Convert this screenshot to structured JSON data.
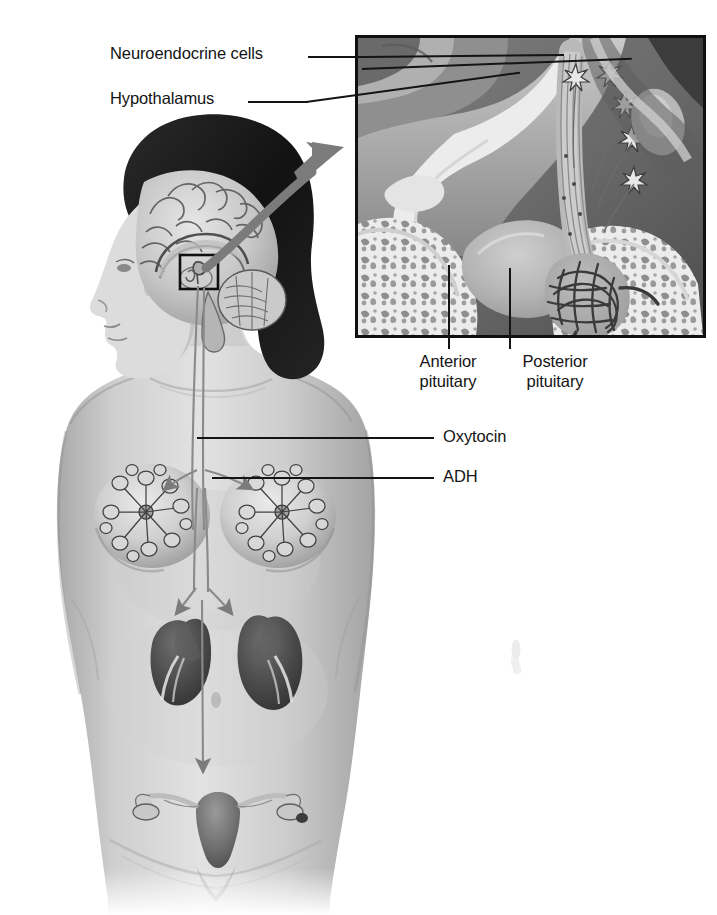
{
  "figure": {
    "medium": "grayscale anatomical illustration"
  },
  "labels": {
    "neuroendocrine_cells": "Neuroendocrine cells",
    "hypothalamus": "Hypothalamus",
    "anterior_pituitary_line1": "Anterior",
    "anterior_pituitary_line2": "pituitary",
    "posterior_pituitary_line1": "Posterior",
    "posterior_pituitary_line2": "pituitary",
    "oxytocin": "Oxytocin",
    "adh": "ADH"
  },
  "inset": {
    "caption": "magnified midsagittal view of the hypothalamus and pituitary gland",
    "structures": [
      "hypothalamus",
      "neuroendocrine cell bodies",
      "hypothalamo-hypophyseal tract axons",
      "infundibulum",
      "anterior pituitary",
      "posterior pituitary capillary plexus",
      "sphenoid bone / sella turcica",
      "optic chiasm"
    ],
    "neuroendocrine_cell_count": 5
  },
  "body_diagram": {
    "structures": [
      "head in profile",
      "brain midsagittal section",
      "cerebellum",
      "pituitary callout box",
      "mammary glands",
      "kidneys",
      "uterus",
      "ovaries",
      "fallopian tubes"
    ],
    "pathways": [
      {
        "hormone": "Oxytocin",
        "targets": [
          "left mammary gland",
          "right mammary gland",
          "uterus"
        ]
      },
      {
        "hormone": "ADH",
        "targets": [
          "left kidney",
          "right kidney"
        ]
      }
    ],
    "callout_arrow": "curved arrow from pituitary box to magnified inset"
  },
  "colors": {
    "ink": "#141414",
    "frame": "#101010",
    "skin_light": "#dcdcdc",
    "skin_mid": "#bdbdbd",
    "skin_shadow": "#9b9b9b",
    "hair_dark": "#1b1b1b",
    "organ_dark": "#4a4a4a",
    "arrow_gray": "#7b7b7b",
    "inset_bone": "#ececec",
    "inset_tissue": "#a5a5a5",
    "inset_dark": "#2a2a2a",
    "background": "#ffffff"
  }
}
